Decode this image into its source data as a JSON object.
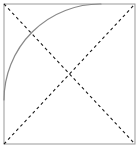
{
  "figure": {
    "canvas": {
      "width": 140,
      "height": 148
    },
    "background_color": "#ffffff",
    "frame": {
      "label": "Square border",
      "x": 4,
      "y": 4,
      "width": 131,
      "height": 140,
      "stroke_color": "#999999",
      "stroke_width": 1,
      "fill": "none"
    },
    "diagonals": [
      {
        "label": "Diagonal top-left to bottom-right",
        "x1": 4,
        "y1": 4,
        "x2": 135,
        "y2": 144,
        "stroke_color": "#1a1a1a",
        "stroke_width": 1.1,
        "dash_pattern": "3 3"
      },
      {
        "label": "Diagonal bottom-left to top-right",
        "x1": 4,
        "y1": 144,
        "x2": 135,
        "y2": 4,
        "stroke_color": "#1a1a1a",
        "stroke_width": 1.1,
        "dash_pattern": "3 3"
      }
    ],
    "arc": {
      "label": "Quarter circle arc centered at top-left corner",
      "center_x": 4,
      "center_y": 4,
      "radius": 96,
      "start_x": 101,
      "start_y": 4,
      "end_x": 4,
      "end_y": 100,
      "stroke_color": "#888888",
      "stroke_width": 1.2,
      "fill": "none"
    },
    "intersection": {
      "label": "Center crossing point",
      "x": 70,
      "y": 74
    }
  }
}
